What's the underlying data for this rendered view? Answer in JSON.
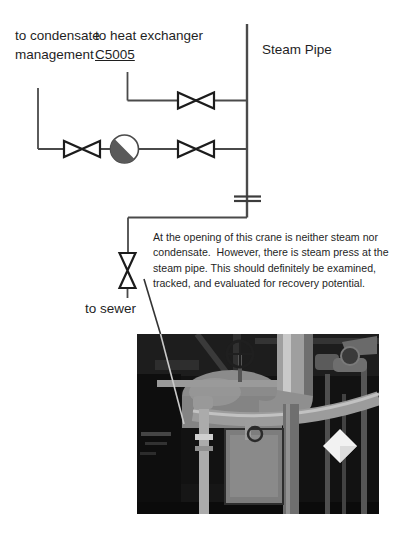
{
  "diagram": {
    "labels": {
      "condensate_destination": "to condensate management",
      "heat_exchanger_line1": "to heat exchanger",
      "heat_exchanger_id": "C5005",
      "steam_pipe": "Steam Pipe",
      "sewer_destination": "to sewer"
    },
    "annotation_text": "At the opening of this crane is neither steam nor condensate.  However, there is steam press at the steam pipe. This should definitely be examined, tracked, and evaluated for recovery potential.",
    "colors": {
      "pipe_line": "#4a4a4a",
      "valve_outline": "#1c1c1c",
      "ball_symbol_fill": "#5a5a5a",
      "text": "#1f1f1f",
      "photo_background": "#121212",
      "tag_diamond": "#f2f2f2"
    }
  }
}
